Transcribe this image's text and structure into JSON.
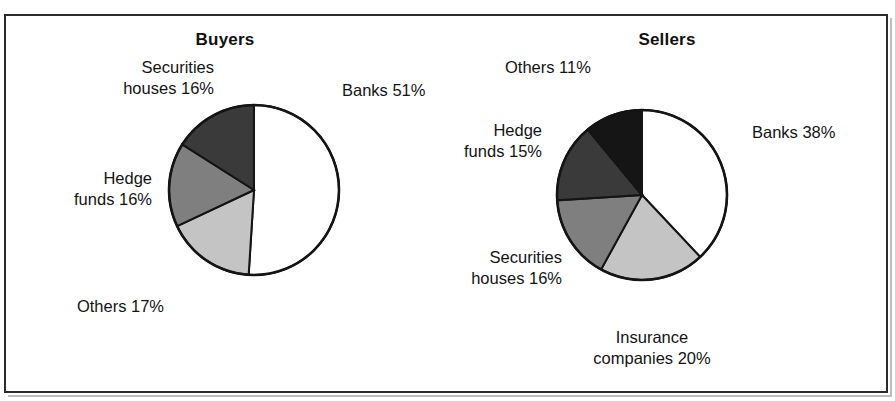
{
  "figure": {
    "background_color": "#ffffff",
    "frame_color": "#2b2b2b"
  },
  "panels": [
    {
      "title": "Buyers"
    },
    {
      "title": "Sellers"
    }
  ],
  "labels": {
    "buyers": {
      "banks": "Banks 51%",
      "securities_houses": "Securities\nhouses 16%",
      "hedge_funds": "Hedge\nfunds 16%",
      "others": "Others 17%"
    },
    "sellers": {
      "banks": "Banks 38%",
      "insurance_companies": "Insurance\ncompanies 20%",
      "securities_houses": "Securities\nhouses 16%",
      "hedge_funds": "Hedge\nfunds 15%",
      "others": "Others 11%"
    }
  },
  "chart_data": [
    {
      "type": "pie",
      "title": "Buyers",
      "labels": [
        "Banks",
        "Others",
        "Hedge funds",
        "Securities houses"
      ],
      "values": [
        51,
        17,
        16,
        16
      ],
      "value_labels": [
        "Banks 51%",
        "Others 17%",
        "Hedge funds 16%",
        "Securities houses 16%"
      ],
      "colors": [
        "#ffffff",
        "#c4c4c4",
        "#7f7f7f",
        "#3a3a3a"
      ],
      "start_angle_deg": 0,
      "direction": "clockwise",
      "units": "percent",
      "total": 100,
      "grid": false,
      "legend": "none (direct slice labels)"
    },
    {
      "type": "pie",
      "title": "Sellers",
      "labels": [
        "Banks",
        "Insurance companies",
        "Securities houses",
        "Hedge funds",
        "Others"
      ],
      "values": [
        38,
        20,
        16,
        15,
        11
      ],
      "value_labels": [
        "Banks 38%",
        "Insurance companies 20%",
        "Securities houses 16%",
        "Hedge funds 15%",
        "Others 11%"
      ],
      "colors": [
        "#ffffff",
        "#c4c4c4",
        "#7f7f7f",
        "#3a3a3a",
        "#151515"
      ],
      "start_angle_deg": 0,
      "direction": "clockwise",
      "units": "percent",
      "total": 100,
      "grid": false,
      "legend": "none (direct slice labels)"
    }
  ]
}
